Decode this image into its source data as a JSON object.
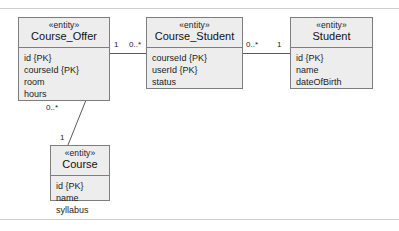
{
  "diagram": {
    "stereotype": "«entity»",
    "border_color": "#7d7d7d",
    "fill_color": "#ededed",
    "line_color": "#5a5a5a",
    "rule_color": "#cfcfcf",
    "entities": [
      {
        "id": "course_offer",
        "name": "Course_Offer",
        "stereotype": "«entity»",
        "attributes": [
          "id {PK}",
          "courseId {PK}",
          "room",
          "hours"
        ]
      },
      {
        "id": "course_student",
        "name": "Course_Student",
        "stereotype": "«entity»",
        "attributes": [
          "courseId {PK}",
          "userId {PK}",
          "status"
        ]
      },
      {
        "id": "student",
        "name": "Student",
        "stereotype": "«entity»",
        "attributes": [
          "id {PK}",
          "name",
          "dateOfBirth"
        ]
      },
      {
        "id": "course",
        "name": "Course",
        "stereotype": "«entity»",
        "attributes": [
          "id {PK}",
          "name",
          "syllabus"
        ]
      }
    ],
    "associations": [
      {
        "id": "offer-to-coursestudent",
        "from": "course_offer",
        "to": "course_student",
        "from_multiplicity": "1",
        "to_multiplicity": "0..*"
      },
      {
        "id": "coursestudent-to-student",
        "from": "course_student",
        "to": "student",
        "from_multiplicity": "0..*",
        "to_multiplicity": "1"
      },
      {
        "id": "offer-to-course",
        "from": "course_offer",
        "to": "course",
        "from_multiplicity": "0..*",
        "to_multiplicity": "1"
      }
    ]
  }
}
